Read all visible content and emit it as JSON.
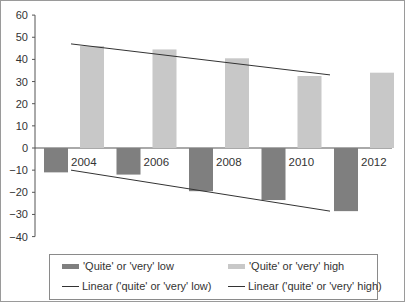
{
  "chart_data": {
    "type": "bar",
    "title": "",
    "xlabel": "",
    "ylabel": "",
    "ylim": [
      -40,
      60
    ],
    "yticks": [
      60,
      50,
      40,
      30,
      20,
      10,
      0,
      -10,
      -20,
      -30,
      -40
    ],
    "ytick_labels": [
      "60",
      "50",
      "40",
      "30",
      "20",
      "10",
      "0",
      "−10",
      "−20",
      "−30",
      "−40"
    ],
    "grid": false,
    "legend_position": "bottom",
    "categories": [
      "2004",
      "2006",
      "2008",
      "2010",
      "2012"
    ],
    "series": [
      {
        "name": "'Quite' or 'very' low",
        "type": "bar",
        "color": "#7f7f7f",
        "values": [
          -11,
          -12,
          -19.5,
          -23.5,
          -28.5
        ]
      },
      {
        "name": "'Quite' or 'very' high",
        "type": "bar",
        "color": "#c8c8c8",
        "values": [
          46,
          44.5,
          40.5,
          32.5,
          34
        ]
      },
      {
        "name": "Linear ('quite' or 'very' low)",
        "type": "line",
        "color": "#333333",
        "values": [
          -10,
          -14.5,
          -19,
          -23.5,
          -28.5
        ]
      },
      {
        "name": "Linear ('quite' or 'very' high)",
        "type": "line",
        "color": "#333333",
        "values": [
          47,
          43.5,
          40,
          36.5,
          33
        ]
      }
    ]
  },
  "legend": {
    "items": [
      {
        "label": "'Quite' or 'very' low",
        "kind": "bar",
        "color": "#7f7f7f"
      },
      {
        "label": "'Quite' or 'very' high",
        "kind": "bar",
        "color": "#c8c8c8"
      },
      {
        "label": "Linear ('quite' or 'very' low)",
        "kind": "line",
        "color": "#333333"
      },
      {
        "label": "Linear ('quite' or 'very' high)",
        "kind": "line",
        "color": "#333333"
      }
    ]
  }
}
